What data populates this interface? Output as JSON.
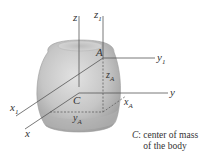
{
  "diagram": {
    "axes": {
      "z": "z",
      "z1": "z",
      "z1_sub": "1",
      "y": "y",
      "y1": "y",
      "y1_sub": "1",
      "x": "x",
      "x1": "x",
      "x1_sub": "1"
    },
    "points": {
      "A": "A",
      "C": "C"
    },
    "distances": {
      "zA": "z",
      "zA_sub": "A",
      "yA": "y",
      "yA_sub": "A",
      "xA": "x",
      "xA_sub": "A"
    },
    "caption": {
      "symbol": "C",
      "line1": ": center of mass",
      "line2": "of the body"
    },
    "colors": {
      "body_fill": "#c8c8c8",
      "body_shade": "#a9a9a9",
      "line": "#555555"
    }
  }
}
